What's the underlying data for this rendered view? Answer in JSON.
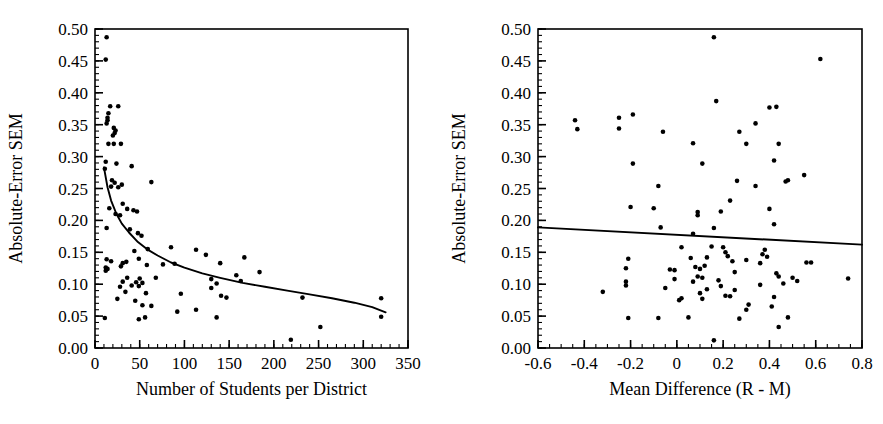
{
  "figure": {
    "background": "#ffffff",
    "ink": "#000000"
  },
  "chart_data": [
    {
      "type": "scatter",
      "panel": "left",
      "title": "",
      "xlabel": "Number of  Students per District",
      "ylabel": "Absolute-Error SEM",
      "xlim": [
        0,
        350
      ],
      "ylim": [
        0.0,
        0.5
      ],
      "xticks": [
        0,
        50,
        100,
        150,
        200,
        250,
        300,
        350
      ],
      "xticklabels": [
        "0",
        "50",
        "100",
        "150",
        "200",
        "250",
        "300",
        "350"
      ],
      "yticks": [
        0.0,
        0.05,
        0.1,
        0.15,
        0.2,
        0.25,
        0.3,
        0.35,
        0.4,
        0.45,
        0.5
      ],
      "yticklabels": [
        "0.00",
        "0.05",
        "0.10",
        "0.15",
        "0.20",
        "0.25",
        "0.30",
        "0.35",
        "0.40",
        "0.45",
        "0.50"
      ],
      "x_minor_step": 10,
      "y_minor_step": 0.01,
      "grid": false,
      "legend": null,
      "marker": "filled-circle",
      "points": [
        [
          13,
          0.487
        ],
        [
          12,
          0.452
        ],
        [
          17,
          0.379
        ],
        [
          26,
          0.379
        ],
        [
          15,
          0.368
        ],
        [
          14,
          0.361
        ],
        [
          14,
          0.357
        ],
        [
          13,
          0.352
        ],
        [
          21,
          0.345
        ],
        [
          23,
          0.341
        ],
        [
          22,
          0.337
        ],
        [
          20,
          0.333
        ],
        [
          15,
          0.32
        ],
        [
          21,
          0.32
        ],
        [
          29,
          0.32
        ],
        [
          12,
          0.292
        ],
        [
          24,
          0.289
        ],
        [
          41,
          0.285
        ],
        [
          11,
          0.281
        ],
        [
          19,
          0.263
        ],
        [
          22,
          0.259
        ],
        [
          30,
          0.256
        ],
        [
          63,
          0.26
        ],
        [
          18,
          0.253
        ],
        [
          26,
          0.252
        ],
        [
          31,
          0.226
        ],
        [
          16,
          0.219
        ],
        [
          36,
          0.218
        ],
        [
          43,
          0.216
        ],
        [
          47,
          0.214
        ],
        [
          23,
          0.21
        ],
        [
          28,
          0.208
        ],
        [
          13,
          0.188
        ],
        [
          39,
          0.186
        ],
        [
          48,
          0.18
        ],
        [
          52,
          0.176
        ],
        [
          85,
          0.158
        ],
        [
          59,
          0.155
        ],
        [
          113,
          0.154
        ],
        [
          44,
          0.152
        ],
        [
          124,
          0.146
        ],
        [
          167,
          0.142
        ],
        [
          49,
          0.14
        ],
        [
          13,
          0.139
        ],
        [
          18,
          0.136
        ],
        [
          35,
          0.135
        ],
        [
          31,
          0.133
        ],
        [
          140,
          0.133
        ],
        [
          89,
          0.132
        ],
        [
          76,
          0.131
        ],
        [
          58,
          0.13
        ],
        [
          29,
          0.128
        ],
        [
          12,
          0.126
        ],
        [
          14,
          0.124
        ],
        [
          184,
          0.119
        ],
        [
          12,
          0.121
        ],
        [
          158,
          0.114
        ],
        [
          36,
          0.11
        ],
        [
          50,
          0.109
        ],
        [
          68,
          0.11
        ],
        [
          130,
          0.108
        ],
        [
          163,
          0.105
        ],
        [
          31,
          0.104
        ],
        [
          46,
          0.103
        ],
        [
          53,
          0.102
        ],
        [
          136,
          0.101
        ],
        [
          41,
          0.098
        ],
        [
          49,
          0.097
        ],
        [
          28,
          0.096
        ],
        [
          130,
          0.094
        ],
        [
          34,
          0.088
        ],
        [
          57,
          0.086
        ],
        [
          96,
          0.085
        ],
        [
          141,
          0.082
        ],
        [
          232,
          0.079
        ],
        [
          147,
          0.079
        ],
        [
          320,
          0.078
        ],
        [
          25,
          0.077
        ],
        [
          45,
          0.074
        ],
        [
          53,
          0.067
        ],
        [
          63,
          0.066
        ],
        [
          113,
          0.06
        ],
        [
          92,
          0.057
        ],
        [
          11,
          0.047
        ],
        [
          49,
          0.045
        ],
        [
          56,
          0.048
        ],
        [
          136,
          0.048
        ],
        [
          320,
          0.049
        ],
        [
          252,
          0.033
        ],
        [
          219,
          0.013
        ]
      ],
      "fit": {
        "kind": "power-decay",
        "description": "Decaying fitted curve from upper-left to flat right tail",
        "points": [
          [
            10,
            0.283
          ],
          [
            14,
            0.252
          ],
          [
            18,
            0.231
          ],
          [
            24,
            0.21
          ],
          [
            30,
            0.195
          ],
          [
            38,
            0.181
          ],
          [
            48,
            0.166
          ],
          [
            58,
            0.155
          ],
          [
            70,
            0.145
          ],
          [
            85,
            0.134
          ],
          [
            100,
            0.126
          ],
          [
            120,
            0.117
          ],
          [
            140,
            0.11
          ],
          [
            165,
            0.102
          ],
          [
            190,
            0.096
          ],
          [
            215,
            0.09
          ],
          [
            240,
            0.084
          ],
          [
            265,
            0.078
          ],
          [
            290,
            0.071
          ],
          [
            310,
            0.064
          ],
          [
            325,
            0.056
          ]
        ]
      }
    },
    {
      "type": "scatter",
      "panel": "right",
      "title": "",
      "xlabel": "Mean Difference (R - M)",
      "ylabel": "Absolute-Error SEM",
      "xlim": [
        -0.6,
        0.8
      ],
      "ylim": [
        0.0,
        0.5
      ],
      "xticks": [
        -0.6,
        -0.4,
        -0.2,
        0,
        0.2,
        0.4,
        0.6,
        0.8
      ],
      "xticklabels": [
        "-0.6",
        "-0.4",
        "-0.2",
        "0",
        "0.2",
        "0.4",
        "0.6",
        "0.8"
      ],
      "yticks": [
        0.0,
        0.05,
        0.1,
        0.15,
        0.2,
        0.25,
        0.3,
        0.35,
        0.4,
        0.45,
        0.5
      ],
      "yticklabels": [
        "0.00",
        "0.05",
        "0.10",
        "0.15",
        "0.20",
        "0.25",
        "0.30",
        "0.35",
        "0.40",
        "0.45",
        "0.50"
      ],
      "x_minor_step": 0.05,
      "y_minor_step": 0.01,
      "grid": false,
      "legend": null,
      "marker": "filled-circle",
      "points": [
        [
          0.16,
          0.487
        ],
        [
          0.62,
          0.453
        ],
        [
          0.17,
          0.387
        ],
        [
          0.4,
          0.377
        ],
        [
          0.43,
          0.378
        ],
        [
          -0.25,
          0.361
        ],
        [
          -0.19,
          0.366
        ],
        [
          -0.44,
          0.357
        ],
        [
          0.34,
          0.352
        ],
        [
          -0.43,
          0.343
        ],
        [
          -0.25,
          0.344
        ],
        [
          0.27,
          0.339
        ],
        [
          -0.06,
          0.339
        ],
        [
          0.07,
          0.321
        ],
        [
          0.3,
          0.32
        ],
        [
          0.44,
          0.32
        ],
        [
          0.42,
          0.294
        ],
        [
          -0.19,
          0.289
        ],
        [
          0.11,
          0.289
        ],
        [
          0.55,
          0.271
        ],
        [
          0.26,
          0.262
        ],
        [
          0.47,
          0.261
        ],
        [
          0.48,
          0.263
        ],
        [
          -0.08,
          0.254
        ],
        [
          0.34,
          0.254
        ],
        [
          0.23,
          0.231
        ],
        [
          -0.2,
          0.221
        ],
        [
          0.4,
          0.218
        ],
        [
          0.19,
          0.214
        ],
        [
          -0.1,
          0.219
        ],
        [
          0.09,
          0.213
        ],
        [
          0.09,
          0.208
        ],
        [
          0.42,
          0.194
        ],
        [
          -0.07,
          0.189
        ],
        [
          0.16,
          0.188
        ],
        [
          0.07,
          0.179
        ],
        [
          0.15,
          0.159
        ],
        [
          0.02,
          0.158
        ],
        [
          0.2,
          0.158
        ],
        [
          0.38,
          0.154
        ],
        [
          0.21,
          0.15
        ],
        [
          0.37,
          0.147
        ],
        [
          0.39,
          0.143
        ],
        [
          0.22,
          0.144
        ],
        [
          0.13,
          0.142
        ],
        [
          0.06,
          0.141
        ],
        [
          -0.21,
          0.14
        ],
        [
          0.3,
          0.138
        ],
        [
          0.24,
          0.136
        ],
        [
          0.56,
          0.134
        ],
        [
          0.58,
          0.134
        ],
        [
          0.36,
          0.133
        ],
        [
          0.12,
          0.129
        ],
        [
          0.08,
          0.127
        ],
        [
          0.1,
          0.124
        ],
        [
          -0.03,
          0.123
        ],
        [
          -0.01,
          0.122
        ],
        [
          0.25,
          0.119
        ],
        [
          0.43,
          0.117
        ],
        [
          -0.22,
          0.125
        ],
        [
          0.09,
          0.112
        ],
        [
          0.11,
          0.11
        ],
        [
          0.44,
          0.112
        ],
        [
          0.5,
          0.11
        ],
        [
          0.74,
          0.109
        ],
        [
          -0.01,
          0.108
        ],
        [
          0.18,
          0.106
        ],
        [
          0.52,
          0.105
        ],
        [
          -0.22,
          0.104
        ],
        [
          0.07,
          0.104
        ],
        [
          0.46,
          0.101
        ],
        [
          0.36,
          0.099
        ],
        [
          0.19,
          0.097
        ],
        [
          -0.22,
          0.098
        ],
        [
          -0.05,
          0.094
        ],
        [
          0.13,
          0.092
        ],
        [
          0.25,
          0.091
        ],
        [
          -0.32,
          0.088
        ],
        [
          0.1,
          0.086
        ],
        [
          0.21,
          0.082
        ],
        [
          0.23,
          0.081
        ],
        [
          0.42,
          0.08
        ],
        [
          0.02,
          0.078
        ],
        [
          0.11,
          0.077
        ],
        [
          0.01,
          0.075
        ],
        [
          0.31,
          0.068
        ],
        [
          0.41,
          0.065
        ],
        [
          0.3,
          0.06
        ],
        [
          0.05,
          0.048
        ],
        [
          -0.08,
          0.047
        ],
        [
          -0.21,
          0.047
        ],
        [
          0.27,
          0.046
        ],
        [
          0.48,
          0.048
        ],
        [
          0.44,
          0.033
        ],
        [
          0.16,
          0.012
        ]
      ],
      "fit": {
        "kind": "linear",
        "description": "Nearly flat regression line with slight negative slope",
        "points": [
          [
            -0.6,
            0.189
          ],
          [
            0.8,
            0.162
          ]
        ]
      }
    }
  ]
}
